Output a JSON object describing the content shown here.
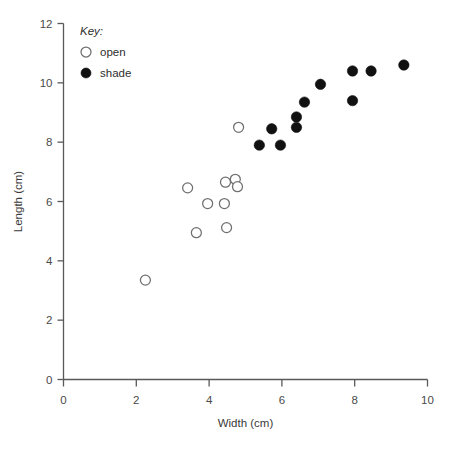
{
  "chart_data": {
    "type": "scatter",
    "title": "",
    "xlabel": "Width (cm)",
    "ylabel": "Length (cm)",
    "xlim": [
      0,
      10
    ],
    "ylim": [
      0,
      12
    ],
    "xticks": [
      0,
      2,
      4,
      6,
      8,
      10
    ],
    "yticks": [
      0,
      2,
      4,
      6,
      8,
      10,
      12
    ],
    "xtick_labels": [
      "0",
      "2",
      "4",
      "6",
      "8",
      "10"
    ],
    "ytick_labels": [
      "0",
      "2",
      "4",
      "6",
      "8",
      "10",
      "12"
    ],
    "grid": false,
    "legend": {
      "title": "Key:",
      "position": "top-left-inside",
      "entries": [
        {
          "label": "open",
          "marker": "open-circle"
        },
        {
          "label": "shade",
          "marker": "filled-circle"
        }
      ]
    },
    "series": [
      {
        "name": "open",
        "marker": "open-circle",
        "color": "#ffffff",
        "edge_color": "#6f6f70",
        "points": [
          {
            "x": 2.25,
            "y": 3.35
          },
          {
            "x": 3.41,
            "y": 6.46
          },
          {
            "x": 3.65,
            "y": 4.95
          },
          {
            "x": 3.96,
            "y": 5.93
          },
          {
            "x": 4.42,
            "y": 5.93
          },
          {
            "x": 4.48,
            "y": 5.12
          },
          {
            "x": 4.45,
            "y": 6.65
          },
          {
            "x": 4.72,
            "y": 6.75
          },
          {
            "x": 4.78,
            "y": 6.5
          },
          {
            "x": 4.81,
            "y": 8.5
          }
        ]
      },
      {
        "name": "shade",
        "marker": "filled-circle",
        "color": "#111111",
        "edge_color": "#111111",
        "points": [
          {
            "x": 5.38,
            "y": 7.9
          },
          {
            "x": 5.96,
            "y": 7.9
          },
          {
            "x": 5.72,
            "y": 8.45
          },
          {
            "x": 6.4,
            "y": 8.85
          },
          {
            "x": 6.4,
            "y": 8.5
          },
          {
            "x": 6.62,
            "y": 9.35
          },
          {
            "x": 7.06,
            "y": 9.95
          },
          {
            "x": 7.94,
            "y": 10.4
          },
          {
            "x": 7.94,
            "y": 9.4
          },
          {
            "x": 8.45,
            "y": 10.4
          },
          {
            "x": 9.35,
            "y": 10.6
          }
        ]
      }
    ]
  }
}
